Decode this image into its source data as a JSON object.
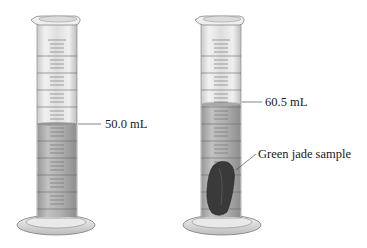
{
  "figure": {
    "left_cylinder": {
      "label": "50.0 mL",
      "water_level_ml": 50.0,
      "contains_sample": false
    },
    "right_cylinder": {
      "label": "60.5 mL",
      "water_level_ml": 60.5,
      "contains_sample": true,
      "sample_label": "Green jade sample"
    },
    "colors": {
      "glass": "#e6e6e6",
      "liquid": "#b5b5b5",
      "sample": "#3a3a3a",
      "graduation": "#6a6a6a"
    }
  }
}
